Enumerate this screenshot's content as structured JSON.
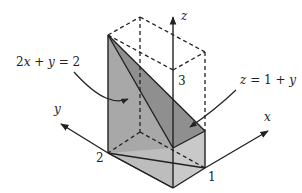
{
  "diagram": {
    "title": "",
    "axes": {
      "x": {
        "label": "x",
        "tick_label": "1"
      },
      "y": {
        "label": "y",
        "tick_label": "2"
      },
      "z": {
        "label": "z",
        "tick_label": "3"
      }
    },
    "annotations": [
      {
        "id": "plane",
        "text_parts": [
          "2",
          "x",
          " + ",
          "y",
          " = 2"
        ],
        "text": "2x + y = 2"
      },
      {
        "id": "top-surface",
        "text_parts": [
          "z",
          " = 1 + ",
          "y"
        ],
        "text": "z = 1 + y"
      }
    ],
    "colors": {
      "face_light": "#c8c8c8",
      "face_mid": "#a9a9a9",
      "face_dark": "#8e8e8e",
      "line": "#222222"
    }
  }
}
